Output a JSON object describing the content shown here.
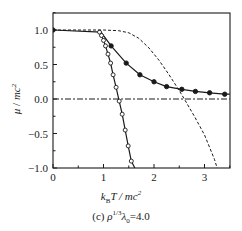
{
  "chart_data": {
    "type": "line",
    "title": "",
    "caption": "(c) ρ^{1/3}λ₀=4.0",
    "caption_text": "(c) ρ1/3λ0=4.0",
    "xlabel": "k_B T / mc²",
    "ylabel": "μ / mc²",
    "xlim": [
      0,
      3.5
    ],
    "ylim": [
      -1.0,
      1.25
    ],
    "x_ticks": [
      0,
      1,
      2,
      3
    ],
    "x_tick_labels": [
      "0",
      "1",
      "2",
      "3"
    ],
    "y_ticks": [
      -1.0,
      -0.5,
      0.0,
      0.5,
      1.0
    ],
    "y_tick_labels": [
      "−1.0",
      "−0.5",
      "0.0",
      "0.5",
      "1.0"
    ],
    "grid": false,
    "legend": null,
    "series": [
      {
        "name": "filled-circles",
        "marker": "filled-circle",
        "line": "solid",
        "x": [
          0,
          0.95,
          1.15,
          1.45,
          1.72,
          2.0,
          2.25,
          2.55,
          2.82,
          3.1,
          3.4,
          3.5
        ],
        "y": [
          1.0,
          0.97,
          0.77,
          0.52,
          0.35,
          0.25,
          0.18,
          0.14,
          0.11,
          0.09,
          0.07,
          0.07
        ],
        "marker_x": [
          0,
          1.15,
          1.45,
          1.72,
          2.0,
          2.25,
          2.55,
          2.82,
          3.1,
          3.4
        ],
        "marker_y": [
          1.0,
          0.77,
          0.52,
          0.35,
          0.25,
          0.18,
          0.14,
          0.11,
          0.09,
          0.07
        ]
      },
      {
        "name": "open-circles",
        "marker": "open-circle",
        "line": "solid",
        "x": [
          0.92,
          0.96,
          1.0,
          1.04,
          1.09,
          1.14,
          1.19,
          1.25,
          1.31,
          1.37,
          1.43,
          1.49,
          1.55,
          1.62
        ],
        "y": [
          0.97,
          0.92,
          0.85,
          0.77,
          0.65,
          0.52,
          0.35,
          0.17,
          -0.03,
          -0.22,
          -0.45,
          -0.68,
          -0.9,
          -1.0
        ],
        "marker_x": [
          0.92,
          0.96,
          1.0,
          1.04,
          1.09,
          1.14,
          1.19,
          1.25,
          1.31,
          1.37,
          1.43,
          1.49,
          1.55
        ],
        "marker_y": [
          0.97,
          0.92,
          0.85,
          0.77,
          0.65,
          0.52,
          0.35,
          0.17,
          -0.03,
          -0.22,
          -0.45,
          -0.68,
          -0.9
        ]
      },
      {
        "name": "dashed-curve",
        "marker": "none",
        "line": "dashed",
        "x": [
          0,
          1.0,
          1.3,
          1.5,
          1.7,
          1.9,
          2.1,
          2.3,
          2.5,
          2.6,
          2.8,
          3.0,
          3.2,
          3.25
        ],
        "y": [
          1.0,
          1.0,
          0.99,
          0.96,
          0.88,
          0.74,
          0.56,
          0.35,
          0.12,
          0.0,
          -0.25,
          -0.52,
          -0.88,
          -1.0
        ]
      },
      {
        "name": "zero-reference",
        "marker": "none",
        "line": "dash-dot",
        "x": [
          0,
          3.5
        ],
        "y": [
          0,
          0
        ]
      }
    ]
  },
  "labels": {
    "ylabel": "μ / mc²",
    "xlabel": "kBT / mc²",
    "caption": "(c) ρ1/3λ0=4.0"
  },
  "colors": {
    "line": "#1a1a1a",
    "frame": "#1a1a1a",
    "background": "#ffffff"
  }
}
